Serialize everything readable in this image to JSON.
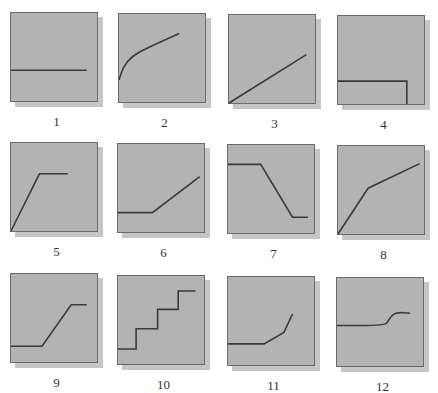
{
  "figure": {
    "colors": {
      "panel_fill": "#b3b3b3",
      "panel_border": "#6a6a6a",
      "shadow": "#c6c6c6",
      "curve": "#3a3a3a",
      "label": "#333333"
    },
    "panels": [
      {
        "label": "1",
        "shape": "horizontal flat line at lower-middle"
      },
      {
        "label": "2",
        "shape": "concave rising curve (logarithmic)"
      },
      {
        "label": "3",
        "shape": "straight linear rise"
      },
      {
        "label": "4",
        "shape": "flat low line then vertical drop at right"
      },
      {
        "label": "5",
        "shape": "steep linear rise then plateau"
      },
      {
        "label": "6",
        "shape": "flat then linear rise"
      },
      {
        "label": "7",
        "shape": "high plateau, linear decline, low plateau"
      },
      {
        "label": "8",
        "shape": "steep rise then gentler rise"
      },
      {
        "label": "9",
        "shape": "low plateau, linear rise, high plateau"
      },
      {
        "label": "10",
        "shape": "staircase of three steps"
      },
      {
        "label": "11",
        "shape": "flat then accelerating rise"
      },
      {
        "label": "12",
        "shape": "flat then small sigmoid bump up"
      }
    ]
  },
  "chart_data": {
    "type": "line",
    "title": "",
    "xlabel": "",
    "ylabel": "",
    "grid": false,
    "note": "12 small schematic graphs; coordinates normalized to 0-100 (x right, y up)",
    "panels": [
      {
        "label": "1",
        "points": [
          [
            0,
            35
          ],
          [
            88,
            35
          ]
        ]
      },
      {
        "label": "2",
        "points": [
          [
            0,
            25
          ],
          [
            5,
            40
          ],
          [
            15,
            52
          ],
          [
            30,
            60
          ],
          [
            70,
            78
          ]
        ]
      },
      {
        "label": "3",
        "points": [
          [
            0,
            0
          ],
          [
            90,
            55
          ]
        ]
      },
      {
        "label": "4",
        "points": [
          [
            0,
            26
          ],
          [
            80,
            26
          ],
          [
            80,
            0
          ]
        ]
      },
      {
        "label": "5",
        "points": [
          [
            0,
            0
          ],
          [
            33,
            65
          ],
          [
            66,
            65
          ]
        ]
      },
      {
        "label": "6",
        "points": [
          [
            0,
            22
          ],
          [
            40,
            22
          ],
          [
            95,
            63
          ]
        ]
      },
      {
        "label": "7",
        "points": [
          [
            0,
            78
          ],
          [
            38,
            78
          ],
          [
            75,
            18
          ],
          [
            93,
            18
          ]
        ]
      },
      {
        "label": "8",
        "points": [
          [
            0,
            0
          ],
          [
            35,
            52
          ],
          [
            95,
            80
          ]
        ]
      },
      {
        "label": "9",
        "points": [
          [
            0,
            18
          ],
          [
            36,
            18
          ],
          [
            70,
            65
          ],
          [
            88,
            65
          ]
        ]
      },
      {
        "label": "10",
        "points": [
          [
            0,
            17
          ],
          [
            21,
            17
          ],
          [
            21,
            40
          ],
          [
            46,
            40
          ],
          [
            46,
            62
          ],
          [
            70,
            62
          ],
          [
            70,
            83
          ],
          [
            90,
            83
          ]
        ]
      },
      {
        "label": "11",
        "points": [
          [
            0,
            24
          ],
          [
            42,
            24
          ],
          [
            65,
            37
          ],
          [
            75,
            58
          ]
        ]
      },
      {
        "label": "12",
        "points": [
          [
            0,
            46
          ],
          [
            56,
            46
          ],
          [
            60,
            52
          ],
          [
            65,
            59
          ],
          [
            72,
            61
          ],
          [
            85,
            60
          ]
        ]
      }
    ]
  }
}
